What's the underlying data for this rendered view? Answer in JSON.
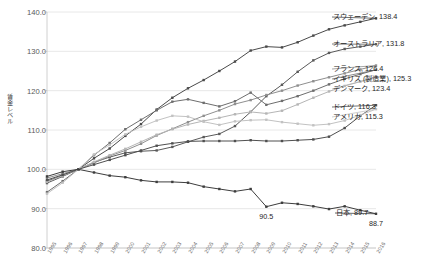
{
  "chart_data": {
    "type": "line",
    "title": "",
    "xlabel": "",
    "ylabel": "賃金レベル",
    "ylim": [
      80.0,
      140.0
    ],
    "yticks": [
      "80.0",
      "90.0",
      "100.0",
      "110.0",
      "120.0",
      "130.0",
      "140.0"
    ],
    "grid": true,
    "legend_position": "right-inline-end-labels",
    "base_note": "1997=100",
    "categories": [
      "1995",
      "1996",
      "1997",
      "1998",
      "1999",
      "2000",
      "2001",
      "2002",
      "2003",
      "2004",
      "2005",
      "2006",
      "2007",
      "2008",
      "2009",
      "2010",
      "2011",
      "2012",
      "2013",
      "2014",
      "2015",
      "2016"
    ],
    "series": [
      {
        "name": "スウェーデン",
        "end_value": 138.4,
        "color": "#4a4a4a",
        "values": [
          97.0,
          98.4,
          100.0,
          102.8,
          105.3,
          108.5,
          111.5,
          115.2,
          118.2,
          120.6,
          122.7,
          125.0,
          127.4,
          130.2,
          131.2,
          131.0,
          132.3,
          134.0,
          135.6,
          136.6,
          137.5,
          138.4
        ]
      },
      {
        "name": "オーストラリア",
        "end_value": 131.8,
        "color": "#5a5a5a",
        "values": [
          96.5,
          98.2,
          100.0,
          101.8,
          103.1,
          104.2,
          104.6,
          104.8,
          105.7,
          107.0,
          108.2,
          109.0,
          111.0,
          114.6,
          118.6,
          121.5,
          124.8,
          127.7,
          129.6,
          130.6,
          131.2,
          131.8
        ]
      },
      {
        "name": "フランス",
        "end_value": 126.4,
        "color": "#8f8f8f",
        "values": [
          97.8,
          98.9,
          100.0,
          101.6,
          103.4,
          104.8,
          106.5,
          108.6,
          110.3,
          112.0,
          113.6,
          115.0,
          116.6,
          117.6,
          118.9,
          120.0,
          121.3,
          122.4,
          123.4,
          124.4,
          125.4,
          126.4
        ]
      },
      {
        "name": "イギリス (製造業)",
        "end_value": 125.3,
        "color": "#6e6e6e",
        "values": [
          94.2,
          97.0,
          100.0,
          103.6,
          106.7,
          110.2,
          112.6,
          115.0,
          117.2,
          117.8,
          116.9,
          116.0,
          117.3,
          119.5,
          116.4,
          117.4,
          118.6,
          120.0,
          121.6,
          123.0,
          124.2,
          125.3
        ]
      },
      {
        "name": "デンマーク",
        "end_value": 123.4,
        "color": "#b5b5b5",
        "values": [
          96.8,
          98.4,
          100.0,
          101.9,
          103.6,
          105.2,
          107.0,
          108.8,
          110.2,
          111.4,
          112.3,
          113.1,
          114.0,
          114.6,
          114.2,
          114.9,
          116.5,
          118.2,
          119.8,
          121.2,
          122.3,
          123.4
        ]
      },
      {
        "name": "ドイツ",
        "end_value": 116.3,
        "color": "#4f4f4f",
        "values": [
          97.3,
          98.6,
          100.0,
          101.2,
          102.4,
          103.6,
          104.8,
          106.0,
          106.6,
          107.1,
          107.2,
          107.2,
          107.2,
          107.4,
          107.2,
          107.2,
          107.4,
          107.6,
          108.3,
          110.5,
          113.6,
          116.3
        ]
      },
      {
        "name": "アメリカ",
        "end_value": 115.3,
        "color": "#c2c2c2",
        "values": [
          93.8,
          96.6,
          100.0,
          103.8,
          106.2,
          108.9,
          110.8,
          112.4,
          113.6,
          113.4,
          112.1,
          111.3,
          112.2,
          112.5,
          112.6,
          112.0,
          111.6,
          111.2,
          111.5,
          112.4,
          113.8,
          115.3
        ]
      },
      {
        "name": "日本",
        "end_value": 88.7,
        "color": "#3d3d3d",
        "values": [
          98.2,
          99.4,
          100.0,
          99.2,
          98.4,
          98.0,
          97.2,
          96.8,
          96.8,
          96.6,
          95.6,
          95.0,
          94.4,
          95.0,
          90.5,
          91.5,
          91.2,
          90.6,
          89.9,
          90.6,
          89.6,
          88.7
        ]
      }
    ],
    "annotations": [
      {
        "text": "90.5",
        "series": "日本",
        "x": "2009"
      },
      {
        "text": "88.7",
        "series": "日本",
        "x": "2016"
      }
    ],
    "end_labels": [
      {
        "text": "スウェーデン, 138.4"
      },
      {
        "text": "オーストラリア, 131.8"
      },
      {
        "text": "フランス, 126.4"
      },
      {
        "text": "イギリス (製造業), 125.3"
      },
      {
        "text": "デンマーク, 123.4"
      },
      {
        "text": "ドイツ, 116.3"
      },
      {
        "text": "アメリカ, 115.3"
      },
      {
        "text": "日本, 89.7"
      }
    ]
  }
}
